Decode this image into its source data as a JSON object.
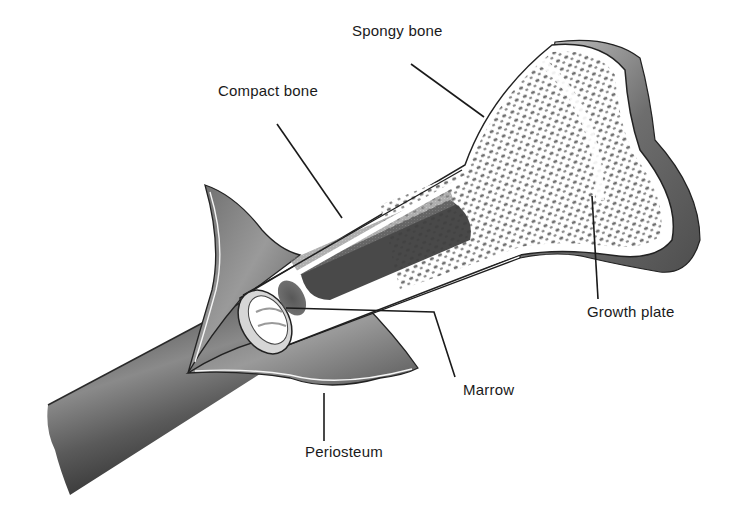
{
  "diagram": {
    "labels": [
      {
        "id": "spongy-bone",
        "text": "Spongy bone",
        "x": 352,
        "y": 29
      },
      {
        "id": "compact-bone",
        "text": "Compact bone",
        "x": 218,
        "y": 89
      },
      {
        "id": "growth-plate",
        "text": "Growth plate",
        "x": 587,
        "y": 306
      },
      {
        "id": "marrow",
        "text": "Marrow",
        "x": 463,
        "y": 384
      },
      {
        "id": "periosteum",
        "text": "Periosteum",
        "x": 305,
        "y": 446
      }
    ],
    "leader_lines": [
      {
        "label": "spongy-bone",
        "points": [
          [
            411,
            64
          ],
          [
            484,
            117
          ]
        ]
      },
      {
        "label": "compact-bone",
        "points": [
          [
            277,
            124
          ],
          [
            342,
            218
          ]
        ]
      },
      {
        "label": "growth-plate",
        "points": [
          [
            592,
            196
          ],
          [
            598,
            299
          ]
        ]
      },
      {
        "label": "marrow",
        "points": [
          [
            286,
            308
          ],
          [
            434,
            312
          ],
          [
            455,
            377
          ]
        ]
      },
      {
        "label": "periosteum",
        "points": [
          [
            324,
            393
          ],
          [
            324,
            441
          ]
        ]
      }
    ],
    "colors": {
      "ink": "#1a1a1a",
      "shade_dark": "#4a4a4a",
      "shade_mid": "#7a7a7a",
      "shade_light": "#b5b5b5",
      "paper": "#ffffff"
    }
  }
}
